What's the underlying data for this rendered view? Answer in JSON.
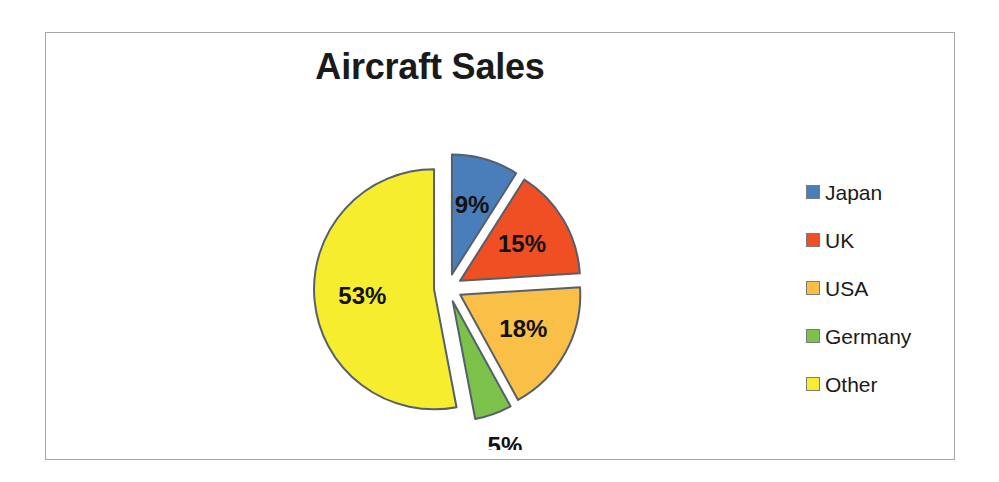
{
  "chart_data": {
    "type": "pie",
    "title": "Aircraft Sales",
    "xlabel": "",
    "ylabel": "",
    "legend_position": "right",
    "grid": false,
    "exploded": true,
    "start_angle_deg": 0,
    "direction": "clockwise",
    "categories": [
      "Japan",
      "UK",
      "USA",
      "Germany",
      "Other"
    ],
    "values": [
      9,
      15,
      18,
      5,
      53
    ],
    "value_unit": "%",
    "data_labels": [
      "9%",
      "15%",
      "18%",
      "5%",
      "53%"
    ],
    "slices": [
      {
        "label": "Japan",
        "value": 9,
        "data_label": "9%",
        "color": "#4A7EBB",
        "label_placement": "inside"
      },
      {
        "label": "UK",
        "value": 15,
        "data_label": "15%",
        "color": "#F04E23",
        "label_placement": "inside"
      },
      {
        "label": "USA",
        "value": 18,
        "data_label": "18%",
        "color": "#F9BF46",
        "label_placement": "inside"
      },
      {
        "label": "Germany",
        "value": 5,
        "data_label": "5%",
        "color": "#7CC24A",
        "label_placement": "outside"
      },
      {
        "label": "Other",
        "value": 53,
        "data_label": "53%",
        "color": "#F7ED2F",
        "label_placement": "inside"
      }
    ]
  },
  "title": {
    "text": "Aircraft Sales"
  },
  "legend": {
    "items": [
      {
        "label": "Japan",
        "color": "#4A7EBB"
      },
      {
        "label": "UK",
        "color": "#F04E23"
      },
      {
        "label": "USA",
        "color": "#F9BF46"
      },
      {
        "label": "Germany",
        "color": "#7CC24A"
      },
      {
        "label": "Other",
        "color": "#F7ED2F"
      }
    ]
  },
  "style": {
    "slice_outline": "#55606B",
    "frame_border": "#a6a6a6",
    "background": "#ffffff",
    "label_text": "#111111"
  }
}
